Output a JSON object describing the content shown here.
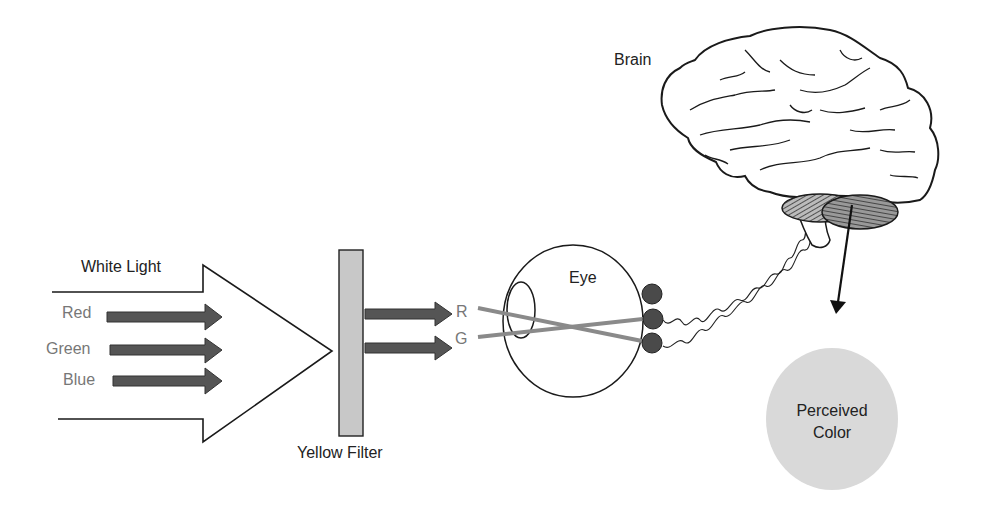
{
  "diagram": {
    "labels": {
      "white_light": "White Light",
      "red": "Red",
      "green": "Green",
      "blue": "Blue",
      "yellow_filter": "Yellow Filter",
      "r": "R",
      "g": "G",
      "eye": "Eye",
      "brain": "Brain",
      "perceived_line1": "Perceived",
      "perceived_line2": "Color"
    },
    "colors": {
      "arrow_fill": "#555555",
      "filter_fill": "#c8c8c8",
      "ray_color": "#8a8a8a",
      "cone_fill": "#4a4a4a",
      "perceived_fill": "#d9d9d9",
      "outline": "#1a1a1a"
    },
    "nodes": [
      {
        "id": "white-light",
        "label": "White Light"
      },
      {
        "id": "yellow-filter",
        "label": "Yellow Filter"
      },
      {
        "id": "eye",
        "label": "Eye"
      },
      {
        "id": "brain",
        "label": "Brain"
      },
      {
        "id": "perceived-color",
        "label": "Perceived Color"
      }
    ],
    "edges": [
      {
        "from": "white-light",
        "to": "yellow-filter",
        "components": [
          "Red",
          "Green",
          "Blue"
        ]
      },
      {
        "from": "yellow-filter",
        "to": "eye",
        "components": [
          "R",
          "G"
        ]
      },
      {
        "from": "eye",
        "to": "brain",
        "type": "optic-nerve"
      },
      {
        "from": "brain",
        "to": "perceived-color",
        "type": "arrow"
      }
    ]
  }
}
